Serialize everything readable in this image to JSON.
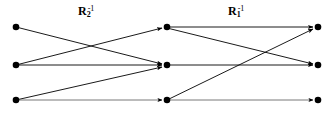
{
  "figure": {
    "type": "bipartite-relation-composition-diagram",
    "width": 335,
    "height": 118,
    "background_color": "#ffffff",
    "ink_color": "#000000"
  },
  "labels": [
    {
      "id": "label-r2-inverse",
      "base": "R",
      "subscript": "2",
      "superscript": "-1",
      "text": "R2^-1",
      "x": 78,
      "y": 5
    },
    {
      "id": "label-r1-inverse",
      "base": "R",
      "subscript": "1",
      "superscript": "-1",
      "text": "R1^-1",
      "x": 228,
      "y": 5
    }
  ],
  "columns": [
    {
      "id": "left-column",
      "x": 16,
      "nodes": [
        {
          "id": "L1",
          "x": 16,
          "y": 27
        },
        {
          "id": "L2",
          "x": 16,
          "y": 65
        },
        {
          "id": "L3",
          "x": 16,
          "y": 100
        }
      ]
    },
    {
      "id": "middle-column",
      "x": 167,
      "nodes": [
        {
          "id": "M1",
          "x": 167,
          "y": 27
        },
        {
          "id": "M2",
          "x": 167,
          "y": 65
        },
        {
          "id": "M3",
          "x": 167,
          "y": 100
        }
      ]
    },
    {
      "id": "right-column",
      "x": 318,
      "nodes": [
        {
          "id": "R1",
          "x": 318,
          "y": 27
        },
        {
          "id": "R2",
          "x": 318,
          "y": 65
        },
        {
          "id": "R3",
          "x": 318,
          "y": 100
        }
      ]
    }
  ],
  "node_radius": 3.3,
  "edges": [
    {
      "id": "e-L1-M2",
      "group": "R2-inverse",
      "from": "L1",
      "to": "M2",
      "x1": 16,
      "y1": 27,
      "x2": 167,
      "y2": 65
    },
    {
      "id": "e-L2-M1",
      "group": "R2-inverse",
      "from": "L2",
      "to": "M1",
      "x1": 16,
      "y1": 65,
      "x2": 167,
      "y2": 27
    },
    {
      "id": "e-L2-M2",
      "group": "R2-inverse",
      "from": "L2",
      "to": "M2",
      "x1": 16,
      "y1": 65,
      "x2": 167,
      "y2": 65
    },
    {
      "id": "e-L3-M2",
      "group": "R2-inverse",
      "from": "L3",
      "to": "M2",
      "x1": 16,
      "y1": 100,
      "x2": 167,
      "y2": 66
    },
    {
      "id": "e-L3-M3",
      "group": "R2-inverse",
      "from": "L3",
      "to": "M3",
      "x1": 16,
      "y1": 100,
      "x2": 167,
      "y2": 100
    },
    {
      "id": "e-M1-R1",
      "group": "R1-inverse",
      "from": "M1",
      "to": "R1",
      "x1": 167,
      "y1": 27,
      "x2": 318,
      "y2": 27
    },
    {
      "id": "e-M1-R2",
      "group": "R1-inverse",
      "from": "M1",
      "to": "R2",
      "x1": 167,
      "y1": 28,
      "x2": 318,
      "y2": 65
    },
    {
      "id": "e-M2-R2",
      "group": "R1-inverse",
      "from": "M2",
      "to": "R2",
      "x1": 167,
      "y1": 65,
      "x2": 318,
      "y2": 65
    },
    {
      "id": "e-M3-R1",
      "group": "R1-inverse",
      "from": "M3",
      "to": "R1",
      "x1": 167,
      "y1": 100,
      "x2": 318,
      "y2": 28
    },
    {
      "id": "e-M3-R3",
      "group": "R1-inverse",
      "from": "M3",
      "to": "R3",
      "x1": 167,
      "y1": 100,
      "x2": 318,
      "y2": 100
    }
  ]
}
